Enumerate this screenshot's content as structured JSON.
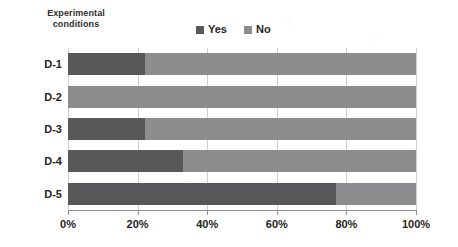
{
  "chart_data": {
    "type": "bar",
    "subtype": "stacked-horizontal-100pct",
    "title": "",
    "axis_title": "Experimental conditions",
    "axis_title_lines": [
      "Experimental",
      "conditions"
    ],
    "xlabel": "",
    "ylabel": "Experimental conditions",
    "categories": [
      "D-1",
      "D-2",
      "D-3",
      "D-4",
      "D-5"
    ],
    "xlim": [
      0,
      100
    ],
    "xticks": [
      0,
      20,
      40,
      60,
      80,
      100
    ],
    "xtick_labels": [
      "0%",
      "20%",
      "40%",
      "60%",
      "80%",
      "100%"
    ],
    "grid": true,
    "grid_axis": "x",
    "legend_position": "top-center",
    "series": [
      {
        "name": "Yes",
        "color": "#58585a",
        "values": [
          22,
          0,
          22,
          33,
          77
        ]
      },
      {
        "name": "No",
        "color": "#8d8d8f",
        "values": [
          78,
          100,
          78,
          67,
          23
        ]
      }
    ]
  },
  "legend": {
    "items": [
      {
        "label": "Yes",
        "color": "#58585a"
      },
      {
        "label": "No",
        "color": "#8d8d8f"
      }
    ]
  },
  "colors": {
    "yes": "#58585a",
    "no": "#8d8d8f",
    "gridline": "#cfcfcf",
    "axis": "#8f8f8f",
    "text": "#232323",
    "background": "#ffffff"
  }
}
